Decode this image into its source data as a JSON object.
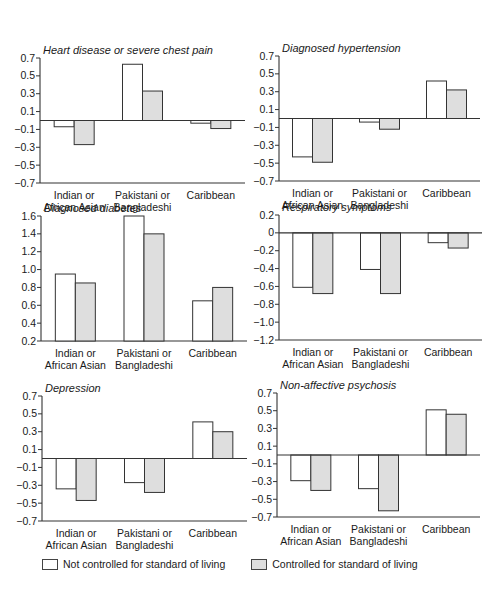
{
  "colors": {
    "not_controlled_fill": "#ffffff",
    "controlled_fill": "#dedede",
    "bar_stroke": "#333333",
    "axis": "#333333"
  },
  "legend": {
    "items": [
      {
        "label": "Not controlled for standard of living",
        "fill": "#ffffff"
      },
      {
        "label": "Controlled for standard of living",
        "fill": "#dedede"
      }
    ]
  },
  "chart_data": [
    {
      "type": "bar",
      "title": "Heart disease or severe chest pain",
      "categories": [
        "Indian or African Asian",
        "Pakistani or Bangladeshi",
        "Caribbean"
      ],
      "category_lines": [
        [
          "Indian or",
          "African Asian"
        ],
        [
          "Pakistani or",
          "Bangladeshi"
        ],
        [
          "Caribbean"
        ]
      ],
      "series": [
        {
          "name": "Not controlled for standard of living",
          "values": [
            -0.07,
            0.63,
            -0.03
          ]
        },
        {
          "name": "Controlled for standard of living",
          "values": [
            -0.27,
            0.33,
            -0.09
          ]
        }
      ],
      "yticks": [
        0.7,
        0.5,
        0.3,
        0.1,
        -0.1,
        -0.3,
        -0.5,
        -0.7
      ],
      "ytick_labels": [
        "0.7",
        "0.5",
        "0.3",
        "0.1",
        "−0.1",
        "−0.3",
        "−0.5",
        "−0.7"
      ],
      "ylim": [
        -0.7,
        0.7
      ],
      "baseline": 0,
      "xlabel": "",
      "ylabel": "",
      "grid": false
    },
    {
      "type": "bar",
      "title": "Diagnosed hypertension",
      "categories": [
        "Indian or African Asian",
        "Pakistani or Bangladeshi",
        "Caribbean"
      ],
      "category_lines": [
        [
          "Indian or",
          "African Asian"
        ],
        [
          "Pakistani or",
          "Bangladeshi"
        ],
        [
          "Caribbean"
        ]
      ],
      "series": [
        {
          "name": "Not controlled for standard of living",
          "values": [
            -0.43,
            -0.04,
            0.42
          ]
        },
        {
          "name": "Controlled for standard of living",
          "values": [
            -0.49,
            -0.12,
            0.32
          ]
        }
      ],
      "yticks": [
        0.7,
        0.5,
        0.3,
        0.1,
        -0.1,
        -0.3,
        -0.5,
        -0.7
      ],
      "ytick_labels": [
        "0.7",
        "0.5",
        "0.3",
        "0.1",
        "−0.1",
        "−0.3",
        "−0.5",
        "−0.7"
      ],
      "ylim": [
        -0.7,
        0.7
      ],
      "baseline": 0,
      "xlabel": "",
      "ylabel": "",
      "grid": false
    },
    {
      "type": "bar",
      "title": "Diagnosed diabetes",
      "categories": [
        "Indian or African Asian",
        "Pakistani or Bangladeshi",
        "Caribbean"
      ],
      "category_lines": [
        [
          "Indian or",
          "African Asian"
        ],
        [
          "Pakistani or",
          "Bangladeshi"
        ],
        [
          "Caribbean"
        ]
      ],
      "series": [
        {
          "name": "Not controlled for standard of living",
          "values": [
            0.95,
            1.6,
            0.65
          ]
        },
        {
          "name": "Controlled for standard of living",
          "values": [
            0.85,
            1.4,
            0.8
          ]
        }
      ],
      "yticks": [
        1.6,
        1.4,
        1.2,
        1.0,
        0.8,
        0.6,
        0.4,
        0.2
      ],
      "ytick_labels": [
        "1.6",
        "1.4",
        "1.2",
        "1.0",
        "0.8",
        "0.6",
        "0.4",
        "0.2"
      ],
      "ylim": [
        0.2,
        1.6
      ],
      "baseline": 0.2,
      "xlabel": "",
      "ylabel": "",
      "grid": false
    },
    {
      "type": "bar",
      "title": "Respiratory symptoms",
      "categories": [
        "Indian or African Asian",
        "Pakistani or Bangladeshi",
        "Caribbean"
      ],
      "category_lines": [
        [
          "Indian or",
          "African Asian"
        ],
        [
          "Pakistani or",
          "Bangladeshi"
        ],
        [
          "Caribbean"
        ]
      ],
      "series": [
        {
          "name": "Not controlled for standard of living",
          "values": [
            -0.61,
            -0.41,
            -0.11
          ]
        },
        {
          "name": "Controlled for standard of living",
          "values": [
            -0.68,
            -0.68,
            -0.17
          ]
        }
      ],
      "yticks": [
        0.2,
        0,
        -0.2,
        -0.4,
        -0.6,
        -0.8,
        -1.0,
        -1.2
      ],
      "ytick_labels": [
        "0.2",
        "0",
        "−0.2",
        "−0.4",
        "−0.6",
        "−0.8",
        "−1.0",
        "−1.2"
      ],
      "ylim": [
        -1.2,
        0.2
      ],
      "baseline": 0,
      "xlabel": "",
      "ylabel": "",
      "grid": false
    },
    {
      "type": "bar",
      "title": "Depression",
      "categories": [
        "Indian or African Asian",
        "Pakistani or Bangladeshi",
        "Caribbean"
      ],
      "category_lines": [
        [
          "Indian or",
          "African Asian"
        ],
        [
          "Pakistani or",
          "Bangladeshi"
        ],
        [
          "Caribbean"
        ]
      ],
      "series": [
        {
          "name": "Not controlled for standard of living",
          "values": [
            -0.34,
            -0.27,
            0.41
          ]
        },
        {
          "name": "Controlled for standard of living",
          "values": [
            -0.47,
            -0.38,
            0.3
          ]
        }
      ],
      "yticks": [
        0.7,
        0.5,
        0.3,
        0.1,
        -0.1,
        -0.3,
        -0.5,
        -0.7
      ],
      "ytick_labels": [
        "0.7",
        "0.5",
        "0.3",
        "0.1",
        "−0.1",
        "−0.3",
        "−0.5",
        "−0.7"
      ],
      "ylim": [
        -0.7,
        0.7
      ],
      "baseline": 0,
      "xlabel": "",
      "ylabel": "",
      "grid": false
    },
    {
      "type": "bar",
      "title": "Non-affective psychosis",
      "categories": [
        "Indian or African Asian",
        "Pakistani or Bangladeshi",
        "Caribbean"
      ],
      "category_lines": [
        [
          "Indian or",
          "African Asian"
        ],
        [
          "Pakistani or",
          "Bangladeshi"
        ],
        [
          "Caribbean"
        ]
      ],
      "series": [
        {
          "name": "Not controlled for standard of living",
          "values": [
            -0.29,
            -0.38,
            0.51
          ]
        },
        {
          "name": "Controlled for standard of living",
          "values": [
            -0.4,
            -0.63,
            0.46
          ]
        }
      ],
      "yticks": [
        0.7,
        0.5,
        0.3,
        0.1,
        -0.1,
        -0.3,
        -0.5,
        -0.7
      ],
      "ytick_labels": [
        "0.7",
        "0.5",
        "0.3",
        "0.1",
        "−0.1",
        "−0.3",
        "−0.5",
        "−0.7"
      ],
      "ylim": [
        -0.7,
        0.7
      ],
      "baseline": 0,
      "xlabel": "",
      "ylabel": "",
      "grid": false
    }
  ],
  "layout": {
    "panels": [
      {
        "left": 0,
        "top": 20,
        "axis_x": 40,
        "plot_right": 245,
        "y_top": 38,
        "y_bottom": 163
      },
      {
        "left": 250,
        "top": 20,
        "axis_x": 29,
        "plot_right": 230,
        "y_top": 36,
        "y_bottom": 161
      },
      {
        "left": 0,
        "top": 198,
        "axis_x": 41,
        "plot_right": 247,
        "y_top": 18,
        "y_bottom": 143
      },
      {
        "left": 250,
        "top": 198,
        "axis_x": 29,
        "plot_right": 232,
        "y_top": 17,
        "y_bottom": 142
      },
      {
        "left": 0,
        "top": 378,
        "axis_x": 42,
        "plot_right": 247,
        "y_top": 18,
        "y_bottom": 143
      },
      {
        "left": 250,
        "top": 378,
        "axis_x": 27,
        "plot_right": 230,
        "y_top": 15,
        "y_bottom": 139
      }
    ]
  }
}
